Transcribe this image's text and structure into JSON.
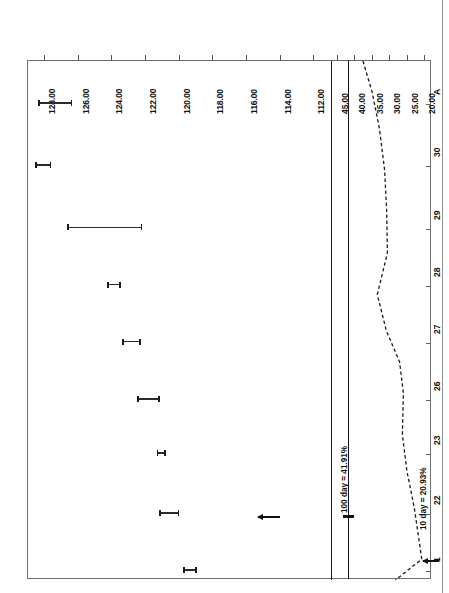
{
  "figure": {
    "title": "Example 4—Gold and Silver",
    "orientation": "page rotated 90 degrees (landscape chart on portrait page)"
  },
  "chart_data": {
    "type": "line",
    "title": "Example 4—Gold and Silver",
    "xlabel": "",
    "ylabel": "",
    "grid": false,
    "legend_position": "none",
    "panes": [
      {
        "name": "price-pane",
        "axis_ticks": [
          "128.00",
          "126.00",
          "124.00",
          "122.00",
          "120.00",
          "118.00",
          "116.00",
          "114.00",
          "112.00"
        ],
        "axis_range": [
          111.0,
          129.0
        ],
        "series": [
          {
            "name": "price-range-bars",
            "type": "range-bar",
            "bars": [
              {
                "date": "A",
                "high": 128.35,
                "low": 126.3
              },
              {
                "date": "30",
                "high": 128.5,
                "low": 127.55
              },
              {
                "date": "29",
                "high": 126.6,
                "low": 122.15
              },
              {
                "date": "28",
                "high": 124.25,
                "low": 123.4
              },
              {
                "date": "27",
                "high": 123.35,
                "low": 122.25
              },
              {
                "date": "26",
                "high": 122.45,
                "low": 121.1
              },
              {
                "date": "23",
                "high": 121.3,
                "low": 120.75
              },
              {
                "date": "22",
                "high": 121.15,
                "low": 119.95
              },
              {
                "date": "1",
                "high": 119.75,
                "low": 118.9
              }
            ]
          }
        ]
      },
      {
        "name": "volatility-pane",
        "axis_ticks": [
          "45.00",
          "40.00",
          "35.00",
          "30.00",
          "25.00",
          "20.00"
        ],
        "axis_range": [
          18.0,
          47.0
        ],
        "series": [
          {
            "name": "100 day",
            "style": "solid",
            "constant_value": 41.91,
            "label": "100 day = 41.91%"
          },
          {
            "name": "10 day",
            "style": "dashed",
            "label": "10 day = 20.93%",
            "end_value": 20.93,
            "points": [
              {
                "t": 0.0,
                "v": 37.8
              },
              {
                "t": 0.06,
                "v": 35.2
              },
              {
                "t": 0.13,
                "v": 33.1
              },
              {
                "t": 0.21,
                "v": 31.6
              },
              {
                "t": 0.29,
                "v": 31.0
              },
              {
                "t": 0.37,
                "v": 30.8
              },
              {
                "t": 0.45,
                "v": 33.7
              },
              {
                "t": 0.52,
                "v": 31.1
              },
              {
                "t": 0.58,
                "v": 27.3
              },
              {
                "t": 0.64,
                "v": 26.2
              },
              {
                "t": 0.72,
                "v": 26.5
              },
              {
                "t": 0.79,
                "v": 25.2
              },
              {
                "t": 0.86,
                "v": 23.1
              },
              {
                "t": 0.92,
                "v": 21.8
              },
              {
                "t": 0.96,
                "v": 20.93
              },
              {
                "t": 1.0,
                "v": 28.5
              }
            ]
          }
        ]
      }
    ],
    "date_ticks": [
      "A",
      "30",
      "29",
      "28",
      "27",
      "26",
      "23",
      "22",
      "1"
    ],
    "annotations": [
      {
        "id": "annot-100day",
        "text": "100 day = 41.91%"
      },
      {
        "id": "annot-10day",
        "text": "10 day = 20.93%"
      }
    ]
  },
  "axis": {
    "value_ticks_price": [
      "128.00",
      "126.00",
      "124.00",
      "122.00",
      "120.00",
      "118.00",
      "116.00",
      "114.00",
      "112.00"
    ],
    "value_ticks_vol": [
      "45.00",
      "40.00",
      "35.00",
      "30.00",
      "25.00",
      "20.00"
    ],
    "date_ticks": [
      "A",
      "30",
      "29",
      "28",
      "27",
      "26",
      "23",
      "22",
      "1"
    ]
  },
  "colors": {
    "ink": "#111111",
    "frame": "#6e6e6e",
    "paper": "#ffffff"
  }
}
